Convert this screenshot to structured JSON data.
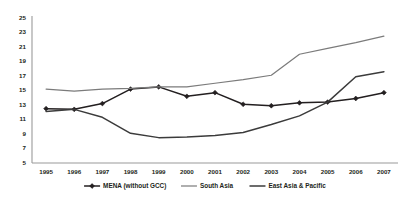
{
  "chart_data": {
    "type": "line",
    "title": "",
    "xlabel": "",
    "ylabel": "",
    "x": [
      1995,
      1996,
      1997,
      1998,
      1999,
      2000,
      2001,
      2002,
      2003,
      2004,
      2005,
      2006,
      2007
    ],
    "xtick_labels": [
      "1995",
      "1996",
      "1997",
      "1998",
      "1999",
      "2000",
      "2001",
      "2002",
      "2003",
      "2004",
      "2005",
      "2006",
      "2007"
    ],
    "ytick_labels": [
      "25",
      "23",
      "21",
      "19",
      "17",
      "15",
      "13",
      "11",
      "9",
      "7",
      "5"
    ],
    "yticks": [
      25,
      23,
      21,
      19,
      17,
      15,
      13,
      11,
      9,
      7,
      5
    ],
    "ylim": [
      5,
      25
    ],
    "grid": false,
    "legend_position": "bottom",
    "series": [
      {
        "name": "MENA (without GCC)",
        "color": "#231f20",
        "marker": "diamond",
        "line_width": 1.5,
        "values": [
          12.5,
          12.4,
          13.2,
          15.2,
          15.5,
          14.2,
          14.7,
          13.1,
          12.9,
          13.3,
          13.4,
          13.9,
          14.7
        ]
      },
      {
        "name": "South Asia",
        "color": "#7b7b7b",
        "marker": "none",
        "line_width": 1.2,
        "values": [
          15.2,
          14.9,
          15.2,
          15.3,
          15.5,
          15.5,
          16.0,
          16.5,
          17.1,
          20.0,
          20.8,
          21.6,
          22.5
        ]
      },
      {
        "name": "East Asia & Pacific",
        "color": "#3b3b3b",
        "marker": "none",
        "line_width": 1.5,
        "values": [
          12.1,
          12.4,
          11.3,
          9.1,
          8.5,
          8.6,
          8.8,
          9.2,
          10.3,
          11.5,
          13.4,
          16.9,
          17.6
        ]
      }
    ]
  },
  "legend": {
    "items": [
      {
        "label": "MENA (without GCC)"
      },
      {
        "label": "South Asia"
      },
      {
        "label": "East Asia & Pacific"
      }
    ]
  }
}
